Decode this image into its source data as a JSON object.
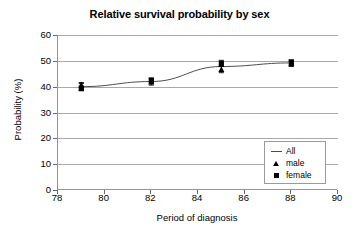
{
  "chart_data": {
    "type": "line",
    "title": "Relative survival probability by sex",
    "xlabel": "Period of diagnosis",
    "ylabel": "Probability (%)",
    "xlim": [
      78,
      90
    ],
    "ylim": [
      0,
      60
    ],
    "xticks": [
      78,
      80,
      82,
      84,
      86,
      88,
      90
    ],
    "yticks": [
      0,
      10,
      20,
      30,
      40,
      50,
      60
    ],
    "grid": "horizontal",
    "legend_position": "lower-right",
    "x": [
      79,
      82,
      85,
      88
    ],
    "series": [
      {
        "name": "All",
        "marker": "line",
        "values": [
          40.0,
          42.0,
          47.8,
          49.2
        ]
      },
      {
        "name": "male",
        "marker": "triangle",
        "values": [
          40.6,
          41.8,
          46.6,
          49.0
        ],
        "error_low": [
          38.6,
          40.6,
          45.4,
          47.8
        ],
        "error_high": [
          41.6,
          43.0,
          47.8,
          50.2
        ]
      },
      {
        "name": "female",
        "marker": "square",
        "values": [
          39.4,
          42.4,
          49.0,
          49.4
        ],
        "error_low": [
          38.4,
          41.2,
          47.8,
          48.2
        ],
        "error_high": [
          41.2,
          43.4,
          50.2,
          50.4
        ]
      }
    ]
  },
  "chart": {
    "title": "Relative survival probability by sex",
    "x_axis_title": "Period of diagnosis",
    "y_axis_title": "Probability (%)",
    "x_tick_labels": [
      "78",
      "80",
      "82",
      "84",
      "86",
      "88",
      "90"
    ],
    "y_tick_labels": [
      "0",
      "10",
      "20",
      "30",
      "40",
      "50",
      "60"
    ]
  },
  "legend": {
    "items": [
      {
        "label": "All",
        "key": "line-key-icon"
      },
      {
        "label": "male",
        "key": "triangle-marker-icon"
      },
      {
        "label": "female",
        "key": "square-marker-icon"
      }
    ]
  }
}
